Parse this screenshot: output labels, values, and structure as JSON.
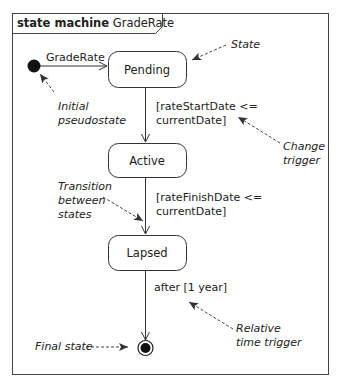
{
  "diagram": {
    "frame": {
      "keyword": "state machine",
      "name": "GradeRate"
    },
    "initial": {
      "transition_label": "GradeRate"
    },
    "states": [
      {
        "name": "Pending"
      },
      {
        "name": "Active"
      },
      {
        "name": "Lapsed"
      }
    ],
    "transitions": [
      {
        "from": "initial",
        "to": "Pending",
        "label": "GradeRate"
      },
      {
        "from": "Pending",
        "to": "Active",
        "label_line1": "[rateStartDate <=",
        "label_line2": "currentDate]"
      },
      {
        "from": "Active",
        "to": "Lapsed",
        "label_line1": "[rateFinishDate <=",
        "label_line2": "currentDate]"
      },
      {
        "from": "Lapsed",
        "to": "final",
        "label": "after [1 year]"
      }
    ],
    "annotations": {
      "state": "State",
      "initial_line1": "Initial",
      "initial_line2": "pseudostate",
      "change_line1": "Change",
      "change_line2": "trigger",
      "transition_line1": "Transition",
      "transition_line2": "between",
      "transition_line3": "states",
      "relative_line1": "Relative",
      "relative_line2": "time trigger",
      "final": "Final state"
    }
  }
}
